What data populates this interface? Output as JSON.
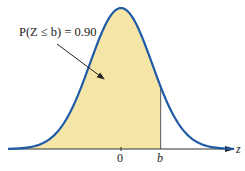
{
  "chart_data": {
    "type": "area",
    "title": "",
    "curve": "standard normal density",
    "annotation": "P(Z ≤ b) = 0.90",
    "xlabel": "z",
    "ylabel": "",
    "x_ticks": [
      "0",
      "b"
    ],
    "shaded_region": {
      "from": "-inf",
      "to": "b",
      "probability": 0.9
    },
    "b_value_approx": 1.28,
    "grid": false,
    "legend": null
  },
  "labels": {
    "annotation": "P(Z ≤ b) = 0.90",
    "tick_zero": "0",
    "tick_b": "b",
    "axis_label": "z"
  },
  "colors": {
    "curve": "#1f5aa6",
    "fill": "#f5e6a8",
    "axis": "#333333",
    "arrow": "#222222"
  }
}
